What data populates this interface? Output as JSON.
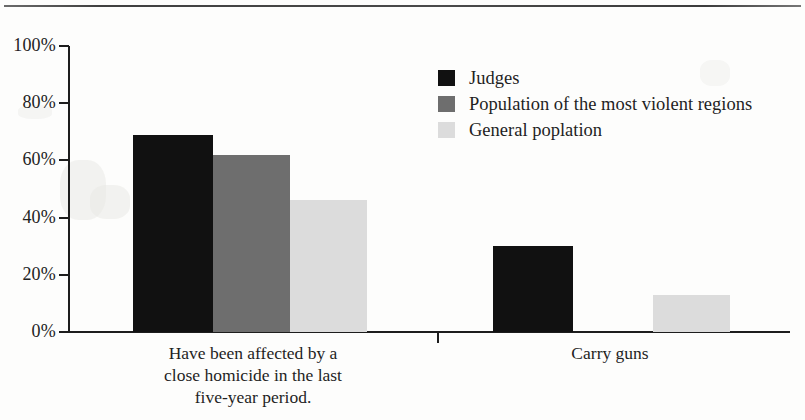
{
  "chart_data": {
    "type": "bar",
    "title": "",
    "subtitle": "",
    "xlabel": "",
    "ylabel": "",
    "ylim": [
      0,
      100
    ],
    "y_unit": "%",
    "grid": false,
    "legend_position": "top-right",
    "categories": [
      "Have been affected by a close homicide in the last five-year period.",
      "Carry guns"
    ],
    "category_lines": [
      [
        "Have been affected by a",
        "close homicide in the last",
        "five-year period."
      ],
      [
        "Carry guns"
      ]
    ],
    "y_ticks": [
      0,
      20,
      40,
      60,
      80,
      100
    ],
    "y_tick_labels": [
      "0%",
      "20%",
      "40%",
      "60%",
      "80%",
      "100%"
    ],
    "series": [
      {
        "name": "Judges",
        "color": "#111111",
        "values": [
          69,
          30
        ]
      },
      {
        "name": "Population of the most violent regions",
        "color": "#6e6e6e",
        "values": [
          62,
          null
        ]
      },
      {
        "name": "General poplation",
        "color": "#dcdcdc",
        "values": [
          46,
          13
        ]
      }
    ]
  },
  "axis": {
    "tick_0": "0%",
    "tick_1": "20%",
    "tick_2": "40%",
    "tick_3": "60%",
    "tick_4": "80%",
    "tick_5": "100%"
  },
  "legend": {
    "items": [
      {
        "label": "Judges",
        "color": "#111111"
      },
      {
        "label": "Population of the most violent regions",
        "color": "#6e6e6e"
      },
      {
        "label": "General poplation",
        "color": "#dcdcdc"
      }
    ]
  },
  "categories_text": {
    "group0_line0": "Have been affected by a",
    "group0_line1": "close homicide in the last",
    "group0_line2": "five-year period.",
    "group1_line0": "Carry guns"
  }
}
